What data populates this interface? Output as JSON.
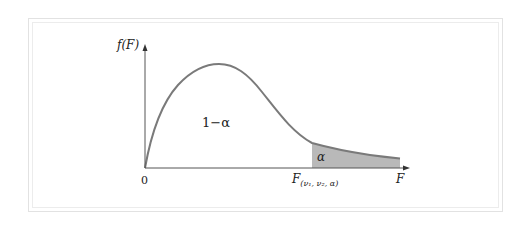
{
  "diagram": {
    "y_axis_label": "f(F)",
    "x_axis_label": "F",
    "origin_label": "0",
    "body_region_label": "1−α",
    "tail_region_label": "α",
    "critical_value_label": {
      "main": "F",
      "subscript": "(ν₁, ν₂, α)"
    },
    "colors": {
      "curve": "#7a7a7a",
      "tail_fill": "#b9b9b9",
      "axes": "#555555",
      "frame": "#e2e2e2"
    }
  }
}
